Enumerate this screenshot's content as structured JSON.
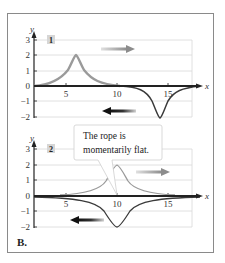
{
  "figure_label": "B.",
  "panels": [
    {
      "id": "1",
      "label": "1",
      "y_axis_label": "y",
      "x_axis_label": "x",
      "y_ticks": [
        "3",
        "2",
        "1",
        "0",
        "−1",
        "−2"
      ],
      "x_ticks": [
        "5",
        "10",
        "15"
      ],
      "pulses": [
        {
          "direction": "right",
          "color": "#9a9a9a",
          "peak_x": 6,
          "amplitude": 2
        },
        {
          "direction": "left",
          "color": "#3a3a3a",
          "peak_x": 14,
          "amplitude": -2
        }
      ]
    },
    {
      "id": "2",
      "label": "2",
      "y_axis_label": "y",
      "x_axis_label": "x",
      "y_ticks": [
        "3",
        "2",
        "1",
        "0",
        "−1",
        "−2"
      ],
      "x_ticks": [
        "5",
        "10",
        "15"
      ],
      "pulses": [
        {
          "direction": "right",
          "color": "#9a9a9a",
          "peak_x": 10,
          "amplitude": 2
        },
        {
          "direction": "left",
          "color": "#3a3a3a",
          "peak_x": 10,
          "amplitude": -2
        }
      ],
      "callout": "The rope is momentarily flat.",
      "callout_lines": [
        "The rope is",
        "momentarily flat."
      ]
    }
  ],
  "colors": {
    "grid": "#d8d8d8",
    "axis": "#222222",
    "rightward_pulse": "#9a9a9a",
    "leftward_pulse": "#3a3a3a",
    "label_bg": "#d6d6d6"
  }
}
